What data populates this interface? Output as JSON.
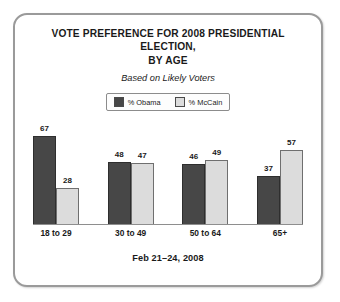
{
  "card": {
    "title_line1": "VOTE PREFERENCE FOR 2008 PRESIDENTIAL ELECTION,",
    "title_line2": "BY AGE",
    "subtitle": "Based on Likely Voters",
    "footer": "Feb 21–24, 2008"
  },
  "legend": {
    "items": [
      {
        "label": "% Obama",
        "color": "#474747"
      },
      {
        "label": "% McCain",
        "color": "#dcdcdc"
      }
    ]
  },
  "chart_data": {
    "type": "bar",
    "title": "VOTE PREFERENCE FOR 2008 PRESIDENTIAL ELECTION, BY AGE",
    "subtitle": "Based on Likely Voters",
    "annotation": "Feb 21–24, 2008",
    "categories": [
      "18 to 29",
      "30 to 49",
      "50 to 64",
      "65+"
    ],
    "series": [
      {
        "name": "% Obama",
        "color": "#474747",
        "values": [
          67,
          48,
          46,
          37
        ]
      },
      {
        "name": "% McCain",
        "color": "#dcdcdc",
        "values": [
          28,
          47,
          49,
          57
        ]
      }
    ],
    "xlabel": "",
    "ylabel": "",
    "ylim": [
      0,
      70
    ],
    "grid": false,
    "axis": "baseline-only",
    "legend_position": "top-center",
    "data_labels": true
  }
}
